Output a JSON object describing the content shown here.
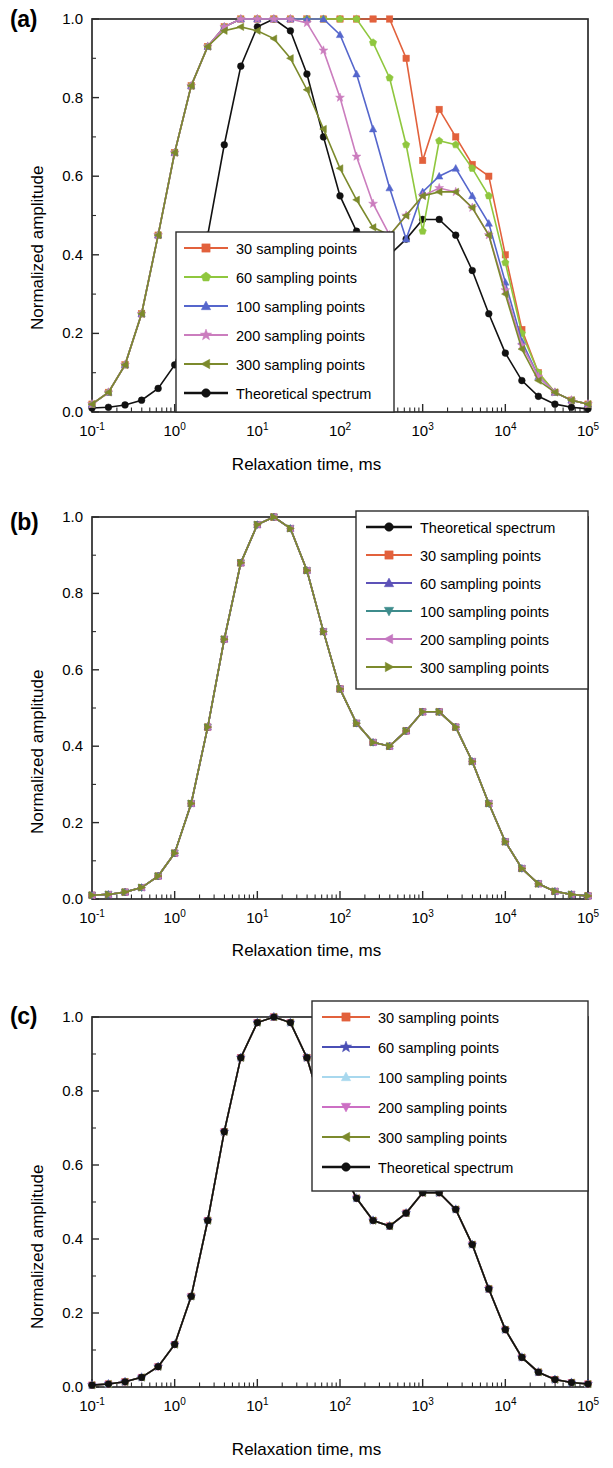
{
  "figure": {
    "panels": [
      {
        "id": "a",
        "label": "(a)",
        "xlabel": "Relaxation time, ms",
        "ylabel": "Normalized amplitude",
        "legend_position": "bottom-center",
        "legend_entries": [
          {
            "label": "30 sampling points",
            "color": "#E2613C",
            "marker": "square"
          },
          {
            "label": "60 sampling points",
            "color": "#8FC73E",
            "marker": "pentagon"
          },
          {
            "label": "100 sampling points",
            "color": "#5566CC",
            "marker": "triangle-up"
          },
          {
            "label": "200 sampling points",
            "color": "#CB7DBE",
            "marker": "star"
          },
          {
            "label": "300 sampling points",
            "color": "#7C8A2C",
            "marker": "triangle-left"
          },
          {
            "label": "Theoretical  spectrum",
            "color": "#111111",
            "marker": "circle"
          }
        ]
      },
      {
        "id": "b",
        "label": "(b)",
        "xlabel": "Relaxation time, ms",
        "ylabel": "Normalized amplitude",
        "legend_position": "top-right",
        "legend_entries": [
          {
            "label": "Theoretical  spectrum",
            "color": "#111111",
            "marker": "circle"
          },
          {
            "label": "30 sampling points",
            "color": "#E2613C",
            "marker": "square"
          },
          {
            "label": "60 sampling points",
            "color": "#5D52B8",
            "marker": "triangle-up"
          },
          {
            "label": "100 sampling points",
            "color": "#3E8C8C",
            "marker": "triangle-down"
          },
          {
            "label": "200 sampling points",
            "color": "#C478C0",
            "marker": "triangle-left"
          },
          {
            "label": "300 sampling points",
            "color": "#7C8A2C",
            "marker": "triangle-right"
          }
        ]
      },
      {
        "id": "c",
        "label": "(c)",
        "xlabel": "Relaxation time, ms",
        "ylabel": "Normalized amplitude",
        "legend_position": "top-right",
        "legend_entries": [
          {
            "label": "30 sampling points",
            "color": "#E2613C",
            "marker": "square"
          },
          {
            "label": "60 sampling points",
            "color": "#4A4FB5",
            "marker": "star"
          },
          {
            "label": "100 sampling points",
            "color": "#A8D8EE",
            "marker": "triangle-up"
          },
          {
            "label": "200 sampling points",
            "color": "#CC6FC4",
            "marker": "triangle-down"
          },
          {
            "label": "300 sampling points",
            "color": "#7C8A2C",
            "marker": "triangle-left"
          },
          {
            "label": "Theoretical  spectrum",
            "color": "#111111",
            "marker": "circle"
          }
        ]
      }
    ],
    "axes": {
      "x_ticks": [
        {
          "base": "10",
          "exp": "-1",
          "value": 0.1
        },
        {
          "base": "10",
          "exp": "0",
          "value": 1
        },
        {
          "base": "10",
          "exp": "1",
          "value": 10
        },
        {
          "base": "10",
          "exp": "2",
          "value": 100
        },
        {
          "base": "10",
          "exp": "3",
          "value": 1000
        },
        {
          "base": "10",
          "exp": "4",
          "value": 10000
        },
        {
          "base": "10",
          "exp": "5",
          "value": 100000
        }
      ],
      "y_ticks": [
        "0.0",
        "0.2",
        "0.4",
        "0.6",
        "0.8",
        "1.0"
      ]
    }
  },
  "chart_data": [
    {
      "type": "line",
      "panel": "a",
      "title": "(a)",
      "xlabel": "Relaxation time, ms",
      "ylabel": "Normalized amplitude",
      "xscale": "log",
      "xlim": [
        0.1,
        100000
      ],
      "ylim": [
        0.0,
        1.0
      ],
      "grid": false,
      "legend": "bottom-center",
      "x": [
        0.1,
        0.158,
        0.251,
        0.398,
        0.631,
        1.0,
        1.585,
        2.512,
        3.981,
        6.31,
        10.0,
        15.85,
        25.12,
        39.81,
        63.1,
        100.0,
        158.5,
        251.2,
        398.1,
        631.0,
        1000.0,
        1585.0,
        2512.0,
        3981.0,
        6310.0,
        10000.0,
        15850.0,
        25120.0,
        39810.0,
        63100.0,
        100000.0
      ],
      "series": [
        {
          "name": "Theoretical  spectrum",
          "color": "#111111",
          "marker": "circle",
          "values": [
            0.01,
            0.012,
            0.018,
            0.03,
            0.06,
            0.12,
            0.25,
            0.45,
            0.68,
            0.88,
            0.98,
            1.0,
            0.97,
            0.86,
            0.7,
            0.55,
            0.46,
            0.41,
            0.4,
            0.44,
            0.49,
            0.49,
            0.45,
            0.36,
            0.25,
            0.15,
            0.08,
            0.04,
            0.02,
            0.012,
            0.008
          ]
        },
        {
          "name": "30 sampling points",
          "color": "#E2613C",
          "marker": "square",
          "values": [
            0.02,
            0.05,
            0.12,
            0.25,
            0.45,
            0.66,
            0.83,
            0.93,
            0.98,
            1.0,
            1.0,
            1.0,
            1.0,
            1.0,
            1.0,
            1.0,
            1.0,
            1.0,
            1.0,
            0.9,
            0.64,
            0.77,
            0.7,
            0.63,
            0.6,
            0.4,
            0.21,
            0.1,
            0.05,
            0.03,
            0.02
          ]
        },
        {
          "name": "60 sampling points",
          "color": "#8FC73E",
          "marker": "pentagon",
          "values": [
            0.02,
            0.05,
            0.12,
            0.25,
            0.45,
            0.66,
            0.83,
            0.93,
            0.98,
            1.0,
            1.0,
            1.0,
            1.0,
            1.0,
            1.0,
            1.0,
            1.0,
            0.94,
            0.85,
            0.68,
            0.46,
            0.69,
            0.68,
            0.62,
            0.55,
            0.38,
            0.2,
            0.1,
            0.05,
            0.03,
            0.02
          ]
        },
        {
          "name": "100 sampling points",
          "color": "#5566CC",
          "marker": "triangle-up",
          "values": [
            0.02,
            0.05,
            0.12,
            0.25,
            0.45,
            0.66,
            0.83,
            0.93,
            0.98,
            1.0,
            1.0,
            1.0,
            1.0,
            1.0,
            1.0,
            0.96,
            0.86,
            0.72,
            0.57,
            0.44,
            0.56,
            0.6,
            0.62,
            0.55,
            0.48,
            0.33,
            0.18,
            0.09,
            0.05,
            0.03,
            0.02
          ]
        },
        {
          "name": "200 sampling points",
          "color": "#CB7DBE",
          "marker": "star",
          "values": [
            0.02,
            0.05,
            0.12,
            0.25,
            0.45,
            0.66,
            0.83,
            0.93,
            0.98,
            1.0,
            1.0,
            1.0,
            1.0,
            0.99,
            0.92,
            0.8,
            0.65,
            0.53,
            0.45,
            0.5,
            0.55,
            0.57,
            0.56,
            0.52,
            0.45,
            0.31,
            0.17,
            0.09,
            0.05,
            0.03,
            0.02
          ]
        },
        {
          "name": "300 sampling points",
          "color": "#7C8A2C",
          "marker": "triangle-left",
          "values": [
            0.02,
            0.05,
            0.12,
            0.25,
            0.45,
            0.66,
            0.83,
            0.93,
            0.97,
            0.98,
            0.97,
            0.95,
            0.9,
            0.82,
            0.72,
            0.62,
            0.54,
            0.47,
            0.45,
            0.5,
            0.55,
            0.56,
            0.56,
            0.52,
            0.45,
            0.3,
            0.16,
            0.08,
            0.05,
            0.03,
            0.02
          ]
        }
      ]
    },
    {
      "type": "line",
      "panel": "b",
      "title": "(b)",
      "xlabel": "Relaxation time, ms",
      "ylabel": "Normalized amplitude",
      "xscale": "log",
      "xlim": [
        0.1,
        100000
      ],
      "ylim": [
        0.0,
        1.0
      ],
      "grid": false,
      "legend": "top-right",
      "note": "All six curves coincide with the theoretical spectrum",
      "x": [
        0.1,
        0.158,
        0.251,
        0.398,
        0.631,
        1.0,
        1.585,
        2.512,
        3.981,
        6.31,
        10.0,
        15.85,
        25.12,
        39.81,
        63.1,
        100.0,
        158.5,
        251.2,
        398.1,
        631.0,
        1000.0,
        1585.0,
        2512.0,
        3981.0,
        6310.0,
        10000.0,
        15850.0,
        25120.0,
        39810.0,
        63100.0,
        100000.0
      ],
      "series": [
        {
          "name": "Theoretical  spectrum",
          "color": "#111111",
          "marker": "circle",
          "values": [
            0.01,
            0.012,
            0.018,
            0.03,
            0.06,
            0.12,
            0.25,
            0.45,
            0.68,
            0.88,
            0.98,
            1.0,
            0.97,
            0.86,
            0.7,
            0.55,
            0.46,
            0.41,
            0.4,
            0.44,
            0.49,
            0.49,
            0.45,
            0.36,
            0.25,
            0.15,
            0.08,
            0.04,
            0.02,
            0.012,
            0.008
          ]
        },
        {
          "name": "30 sampling points",
          "color": "#E2613C",
          "marker": "square",
          "values": [
            0.01,
            0.012,
            0.018,
            0.03,
            0.06,
            0.12,
            0.25,
            0.45,
            0.68,
            0.88,
            0.98,
            1.0,
            0.97,
            0.86,
            0.7,
            0.55,
            0.46,
            0.41,
            0.4,
            0.44,
            0.49,
            0.49,
            0.45,
            0.36,
            0.25,
            0.15,
            0.08,
            0.04,
            0.02,
            0.012,
            0.008
          ]
        },
        {
          "name": "60 sampling points",
          "color": "#5D52B8",
          "marker": "triangle-up",
          "values": [
            0.01,
            0.012,
            0.018,
            0.03,
            0.06,
            0.12,
            0.25,
            0.45,
            0.68,
            0.88,
            0.98,
            1.0,
            0.97,
            0.86,
            0.7,
            0.55,
            0.46,
            0.41,
            0.4,
            0.44,
            0.49,
            0.49,
            0.45,
            0.36,
            0.25,
            0.15,
            0.08,
            0.04,
            0.02,
            0.012,
            0.008
          ]
        },
        {
          "name": "100 sampling points",
          "color": "#3E8C8C",
          "marker": "triangle-down",
          "values": [
            0.01,
            0.012,
            0.018,
            0.03,
            0.06,
            0.12,
            0.25,
            0.45,
            0.68,
            0.88,
            0.98,
            1.0,
            0.97,
            0.86,
            0.7,
            0.55,
            0.46,
            0.41,
            0.4,
            0.44,
            0.49,
            0.49,
            0.45,
            0.36,
            0.25,
            0.15,
            0.08,
            0.04,
            0.02,
            0.012,
            0.008
          ]
        },
        {
          "name": "200 sampling points",
          "color": "#C478C0",
          "marker": "triangle-left",
          "values": [
            0.01,
            0.012,
            0.018,
            0.03,
            0.06,
            0.12,
            0.25,
            0.45,
            0.68,
            0.88,
            0.98,
            1.0,
            0.97,
            0.86,
            0.7,
            0.55,
            0.46,
            0.41,
            0.4,
            0.44,
            0.49,
            0.49,
            0.45,
            0.36,
            0.25,
            0.15,
            0.08,
            0.04,
            0.02,
            0.012,
            0.008
          ]
        },
        {
          "name": "300 sampling points",
          "color": "#7C8A2C",
          "marker": "triangle-right",
          "values": [
            0.01,
            0.012,
            0.018,
            0.03,
            0.06,
            0.12,
            0.25,
            0.45,
            0.68,
            0.88,
            0.98,
            1.0,
            0.97,
            0.86,
            0.7,
            0.55,
            0.46,
            0.41,
            0.4,
            0.44,
            0.49,
            0.49,
            0.45,
            0.36,
            0.25,
            0.15,
            0.08,
            0.04,
            0.02,
            0.012,
            0.008
          ]
        }
      ]
    },
    {
      "type": "line",
      "panel": "c",
      "title": "(c)",
      "xlabel": "Relaxation time, ms",
      "ylabel": "Normalized amplitude",
      "xscale": "log",
      "xlim": [
        0.1,
        100000
      ],
      "ylim": [
        0.0,
        1.0
      ],
      "grid": false,
      "legend": "top-right",
      "note": "All six curves coincide with the theoretical spectrum",
      "x": [
        0.1,
        0.158,
        0.251,
        0.398,
        0.631,
        1.0,
        1.585,
        2.512,
        3.981,
        6.31,
        10.0,
        15.85,
        25.12,
        39.81,
        63.1,
        100.0,
        158.5,
        251.2,
        398.1,
        631.0,
        1000.0,
        1585.0,
        2512.0,
        3981.0,
        6310.0,
        10000.0,
        15850.0,
        25120.0,
        39810.0,
        63100.0,
        100000.0
      ],
      "series": [
        {
          "name": "30 sampling points",
          "color": "#E2613C",
          "marker": "square",
          "values": [
            0.005,
            0.008,
            0.014,
            0.026,
            0.055,
            0.115,
            0.245,
            0.45,
            0.69,
            0.89,
            0.985,
            1.0,
            0.985,
            0.89,
            0.74,
            0.6,
            0.51,
            0.45,
            0.435,
            0.47,
            0.525,
            0.525,
            0.48,
            0.385,
            0.265,
            0.155,
            0.08,
            0.04,
            0.02,
            0.012,
            0.008
          ]
        },
        {
          "name": "60 sampling points",
          "color": "#4A4FB5",
          "marker": "star",
          "values": [
            0.005,
            0.008,
            0.014,
            0.026,
            0.055,
            0.115,
            0.245,
            0.45,
            0.69,
            0.89,
            0.985,
            1.0,
            0.985,
            0.89,
            0.74,
            0.6,
            0.51,
            0.45,
            0.435,
            0.47,
            0.525,
            0.525,
            0.48,
            0.385,
            0.265,
            0.155,
            0.08,
            0.04,
            0.02,
            0.012,
            0.008
          ]
        },
        {
          "name": "100 sampling points",
          "color": "#A8D8EE",
          "marker": "triangle-up",
          "values": [
            0.005,
            0.008,
            0.014,
            0.026,
            0.055,
            0.115,
            0.245,
            0.45,
            0.69,
            0.89,
            0.985,
            1.0,
            0.985,
            0.89,
            0.74,
            0.6,
            0.51,
            0.45,
            0.435,
            0.47,
            0.525,
            0.525,
            0.48,
            0.385,
            0.265,
            0.155,
            0.08,
            0.04,
            0.02,
            0.012,
            0.008
          ]
        },
        {
          "name": "200 sampling points",
          "color": "#CC6FC4",
          "marker": "triangle-down",
          "values": [
            0.005,
            0.008,
            0.014,
            0.026,
            0.055,
            0.115,
            0.245,
            0.45,
            0.69,
            0.89,
            0.985,
            1.0,
            0.985,
            0.89,
            0.74,
            0.6,
            0.51,
            0.45,
            0.435,
            0.47,
            0.525,
            0.525,
            0.48,
            0.385,
            0.265,
            0.155,
            0.08,
            0.04,
            0.02,
            0.012,
            0.008
          ]
        },
        {
          "name": "300 sampling points",
          "color": "#7C8A2C",
          "marker": "triangle-left",
          "values": [
            0.005,
            0.008,
            0.014,
            0.026,
            0.055,
            0.115,
            0.245,
            0.45,
            0.69,
            0.89,
            0.985,
            1.0,
            0.985,
            0.89,
            0.74,
            0.6,
            0.51,
            0.45,
            0.435,
            0.47,
            0.525,
            0.525,
            0.48,
            0.385,
            0.265,
            0.155,
            0.08,
            0.04,
            0.02,
            0.012,
            0.008
          ]
        },
        {
          "name": "Theoretical  spectrum",
          "color": "#111111",
          "marker": "circle",
          "values": [
            0.005,
            0.008,
            0.014,
            0.026,
            0.055,
            0.115,
            0.245,
            0.45,
            0.69,
            0.89,
            0.985,
            1.0,
            0.985,
            0.89,
            0.74,
            0.6,
            0.51,
            0.45,
            0.435,
            0.47,
            0.525,
            0.525,
            0.48,
            0.385,
            0.265,
            0.155,
            0.08,
            0.04,
            0.02,
            0.012,
            0.008
          ]
        }
      ]
    }
  ]
}
